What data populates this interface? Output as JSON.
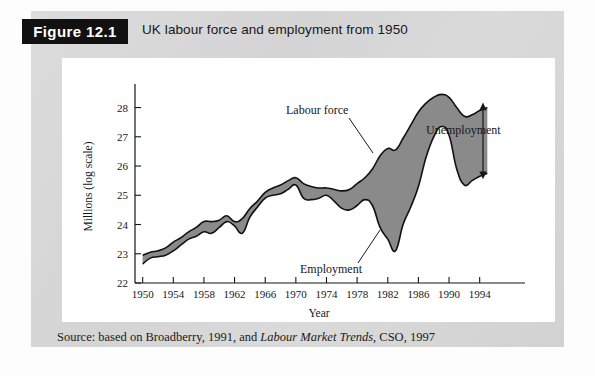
{
  "figure": {
    "number_label": "Figure 12.1",
    "title": "UK labour force and employment from 1950",
    "source": {
      "prefix": "Source: based on Broadberry, 1991, and ",
      "italic": "Labour Market Trends",
      "suffix": ", CSO, 1997"
    }
  },
  "colors": {
    "panel_background": "#d9d9d9",
    "card_background": "#ffffff",
    "band_fill": "#8a8a8a",
    "line_stroke": "#111111",
    "tab_background": "#111111",
    "tab_text": "#ffffff"
  },
  "chart_data": {
    "type": "area",
    "title": "UK labour force and employment from 1950",
    "xlabel": "Year",
    "ylabel": "Millions (log scale)",
    "xlim": [
      1949,
      1996
    ],
    "ylim": [
      22,
      28.6
    ],
    "y_ticks": [
      22,
      23,
      24,
      25,
      26,
      27,
      28
    ],
    "x_ticks": [
      1950,
      1954,
      1958,
      1962,
      1966,
      1970,
      1974,
      1978,
      1982,
      1986,
      1990,
      1994
    ],
    "grid": false,
    "legend": "annotations",
    "annotations": [
      {
        "text": "Labour force",
        "target": "upper-series"
      },
      {
        "text": "Employment",
        "target": "lower-series"
      },
      {
        "text": "Unemployment",
        "target": "gap-between-series"
      }
    ],
    "x": [
      1950,
      1951,
      1952,
      1953,
      1954,
      1955,
      1956,
      1957,
      1958,
      1959,
      1960,
      1961,
      1962,
      1963,
      1964,
      1965,
      1966,
      1967,
      1968,
      1969,
      1970,
      1971,
      1972,
      1973,
      1974,
      1975,
      1976,
      1977,
      1978,
      1979,
      1980,
      1981,
      1982,
      1983,
      1984,
      1985,
      1986,
      1987,
      1988,
      1989,
      1990,
      1991,
      1992,
      1993,
      1994,
      1995
    ],
    "series": [
      {
        "name": "Labour force",
        "values": [
          22.95,
          23.05,
          23.1,
          23.2,
          23.4,
          23.55,
          23.75,
          23.9,
          24.1,
          24.1,
          24.15,
          24.3,
          24.1,
          24.2,
          24.55,
          24.8,
          25.1,
          25.25,
          25.35,
          25.5,
          25.6,
          25.4,
          25.3,
          25.25,
          25.25,
          25.2,
          25.15,
          25.2,
          25.4,
          25.6,
          25.9,
          26.35,
          26.6,
          26.55,
          26.95,
          27.4,
          27.85,
          28.15,
          28.35,
          28.45,
          28.35,
          28.0,
          27.7,
          27.75,
          27.9,
          28.0
        ]
      },
      {
        "name": "Employment",
        "values": [
          22.65,
          22.85,
          22.9,
          22.95,
          23.1,
          23.3,
          23.5,
          23.6,
          23.75,
          23.7,
          23.9,
          24.1,
          23.95,
          23.7,
          24.25,
          24.6,
          24.9,
          25.0,
          25.05,
          25.2,
          25.35,
          24.9,
          24.85,
          24.9,
          25.0,
          24.8,
          24.55,
          24.5,
          24.65,
          24.85,
          24.65,
          23.9,
          23.5,
          23.1,
          24.0,
          24.6,
          25.3,
          26.3,
          27.0,
          27.35,
          27.05,
          25.9,
          25.35,
          25.5,
          25.65,
          25.75
        ]
      }
    ],
    "notable_points": {
      "labour_force_peak": {
        "year": 1989,
        "value": 28.45
      },
      "employment_trough": {
        "year": 1983,
        "value": 23.1
      },
      "first_year_gap": {
        "year": 1950,
        "value": 0.3
      },
      "widest_gap": {
        "year": 1983,
        "value": 3.45
      }
    }
  }
}
